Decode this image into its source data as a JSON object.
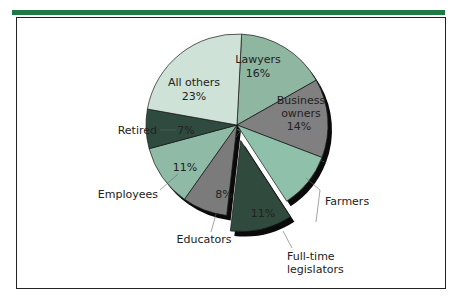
{
  "header": {
    "bar_color": "#1f7a45"
  },
  "chart_data": {
    "type": "pie",
    "title": "",
    "exploded": "Full-time legislators",
    "slices": [
      {
        "label": "Lawyers",
        "value": 16,
        "display": "16%",
        "color": "#8eb6a1"
      },
      {
        "label": "Business owners",
        "value": 14,
        "display": "14%",
        "color": "#808080"
      },
      {
        "label": "Farmers",
        "value": 10,
        "display": "",
        "color": "#8fc1aa"
      },
      {
        "label": "Full-time legislators",
        "value": 11,
        "display": "11%",
        "color": "#304a3e"
      },
      {
        "label": "Educators",
        "value": 8,
        "display": "8%",
        "color": "#7b7b7b"
      },
      {
        "label": "Employees",
        "value": 11,
        "display": "11%",
        "color": "#8fbba6"
      },
      {
        "label": "Retired",
        "value": 7,
        "display": "7%",
        "color": "#2f4a3e"
      },
      {
        "label": "All others",
        "value": 23,
        "display": "23%",
        "color": "#cfe2d7"
      }
    ]
  },
  "labels": {
    "lawyers": "Lawyers",
    "lawyers_pct": "16%",
    "business_1": "Business",
    "business_2": "owners",
    "business_pct": "14%",
    "farmers": "Farmers",
    "legislators_1": "Full-time",
    "legislators_2": "legislators",
    "legislators_pct": "11%",
    "educators": "Educators",
    "educators_pct": "8%",
    "employees": "Employees",
    "employees_pct": "11%",
    "retired": "Retired",
    "retired_pct": "7%",
    "others_1": "All others",
    "others_pct": "23%"
  }
}
